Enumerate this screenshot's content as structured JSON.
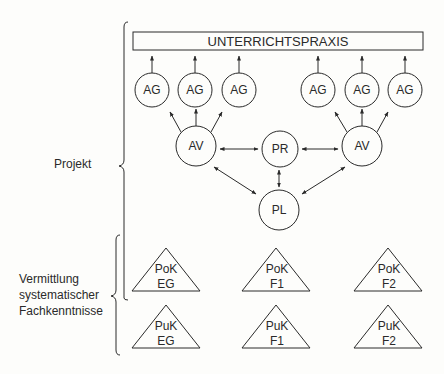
{
  "title_box": {
    "label": "UNTERRICHTSPRAXIS"
  },
  "side_labels": {
    "projekt": "Projekt",
    "vermittlung": [
      "Vermittlung",
      "systematischer",
      "Fachkenntnisse"
    ]
  },
  "nodes": {
    "ag": [
      "AG",
      "AG",
      "AG",
      "AG",
      "AG",
      "AG"
    ],
    "av_left": "AV",
    "av_right": "AV",
    "pr": "PR",
    "pl": "PL"
  },
  "triangles": {
    "pok": [
      {
        "top": "PoK",
        "bottom": "EG"
      },
      {
        "top": "PoK",
        "bottom": "F1"
      },
      {
        "top": "PoK",
        "bottom": "F2"
      }
    ],
    "puk": [
      {
        "top": "PuK",
        "bottom": "EG"
      },
      {
        "top": "PuK",
        "bottom": "F1"
      },
      {
        "top": "PuK",
        "bottom": "F2"
      }
    ]
  },
  "colors": {
    "stroke": "#2a2a2a",
    "background": "#fdfdfb"
  }
}
